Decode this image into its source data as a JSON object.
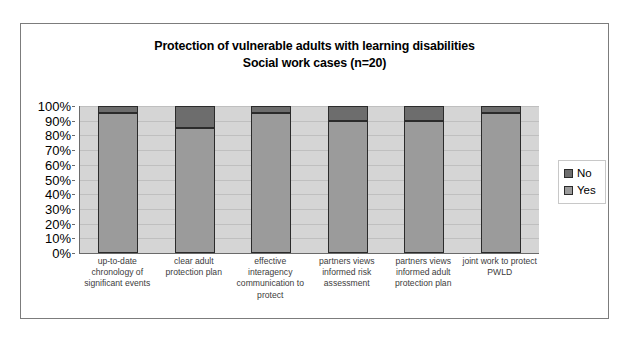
{
  "chart_data": {
    "type": "bar",
    "stacked": true,
    "stacked_percent": true,
    "title": "Protection of vulnerable adults with learning disabilities",
    "subtitle": "Social work cases (n=20)",
    "xlabel": "",
    "ylabel": "",
    "ylim": [
      0,
      100
    ],
    "ytick_labels": [
      "100%",
      "90%",
      "80%",
      "70%",
      "60%",
      "50%",
      "40%",
      "30%",
      "20%",
      "10%",
      "0%"
    ],
    "ytick_values": [
      100,
      90,
      80,
      70,
      60,
      50,
      40,
      30,
      20,
      10,
      0
    ],
    "grid": true,
    "legend_position": "right",
    "categories": [
      "up-to-date chronology of significant events",
      "clear adult protection plan",
      "effective interagency communication to protect",
      "partners views informed risk assessment",
      "partners views informed adult protection plan",
      "joint work to protect PWLD"
    ],
    "series": [
      {
        "name": "Yes",
        "color": "#9b9b9b",
        "values": [
          95,
          85,
          95,
          90,
          90,
          95
        ]
      },
      {
        "name": "No",
        "color": "#6d6d6d",
        "values": [
          5,
          15,
          5,
          10,
          10,
          5
        ]
      }
    ]
  },
  "legend": {
    "entries": [
      {
        "label": "No",
        "color": "#6d6d6d"
      },
      {
        "label": "Yes",
        "color": "#9b9b9b"
      }
    ]
  },
  "colors": {
    "plot_background": "#d5d5d5",
    "gridline": "#bfbfbf",
    "axis": "#6a6a6a",
    "frame": "#7c7c7c",
    "bar_border": "#2b2b2b",
    "text": "#000000",
    "category_text": "#3c3c3c"
  }
}
